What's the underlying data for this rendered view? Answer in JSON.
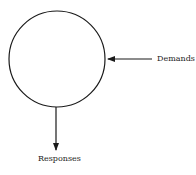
{
  "diagram": {
    "node": {
      "shape": "circle",
      "cx": 57,
      "cy": 59,
      "r": 48,
      "stroke": "#1a1a1a"
    },
    "arrows": [
      {
        "name": "demands",
        "label": "Demands",
        "direction": "into-node",
        "from": [
          152,
          59
        ],
        "to": [
          107,
          59
        ]
      },
      {
        "name": "responses",
        "label": "Responses",
        "direction": "out-of-node",
        "from": [
          56,
          107
        ],
        "to": [
          56,
          150
        ]
      }
    ]
  }
}
